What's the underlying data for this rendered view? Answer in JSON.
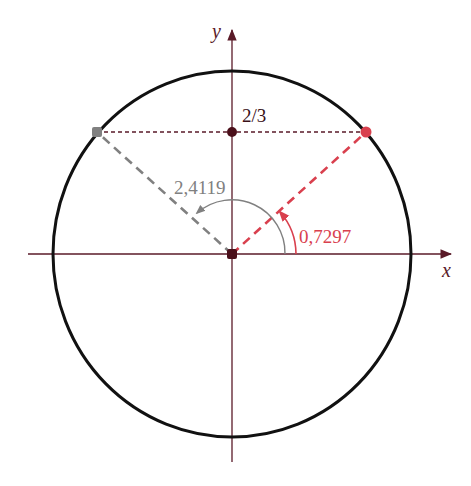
{
  "figure": {
    "type": "unit-circle-diagram",
    "axes": {
      "x_label": "x",
      "y_label": "y"
    },
    "point_label": "2/3",
    "angles": [
      {
        "label": "0,7297",
        "color": "#d9404e"
      },
      {
        "label": "2,4119",
        "color": "#808080"
      }
    ],
    "colors": {
      "axis": "#5a1a28",
      "circle": "#111111",
      "red": "#d9404e",
      "gray": "#808080",
      "dot": "#4a0f1a"
    }
  }
}
